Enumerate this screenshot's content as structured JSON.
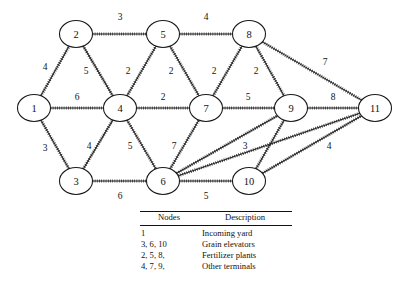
{
  "figure": {
    "kind": "network-diagram"
  },
  "chart_data": {
    "type": "diagram",
    "title": "",
    "xlabel": "",
    "ylabel": "",
    "nodes": [
      {
        "id": "1",
        "label": "1",
        "x": 34,
        "y": 108
      },
      {
        "id": "2",
        "label": "2",
        "x": 76,
        "y": 34
      },
      {
        "id": "3",
        "label": "3",
        "x": 76,
        "y": 181
      },
      {
        "id": "4",
        "label": "4",
        "x": 120,
        "y": 108
      },
      {
        "id": "5",
        "label": "5",
        "x": 163,
        "y": 34
      },
      {
        "id": "6",
        "label": "6",
        "x": 163,
        "y": 181
      },
      {
        "id": "7",
        "label": "7",
        "x": 206,
        "y": 108
      },
      {
        "id": "8",
        "label": "8",
        "x": 249,
        "y": 34
      },
      {
        "id": "9",
        "label": "9",
        "x": 291,
        "y": 108
      },
      {
        "id": "10",
        "label": "10",
        "x": 249,
        "y": 181
      },
      {
        "id": "11",
        "label": "11",
        "x": 375,
        "y": 108
      }
    ],
    "edges": [
      {
        "from": "2",
        "to": "5",
        "weight": "3",
        "lx": 120,
        "ly": 17
      },
      {
        "from": "5",
        "to": "8",
        "weight": "4",
        "lx": 206,
        "ly": 17
      },
      {
        "from": "1",
        "to": "2",
        "weight": "4",
        "lx": 45,
        "ly": 67
      },
      {
        "from": "2",
        "to": "4",
        "weight": "5",
        "lx": 86,
        "ly": 71
      },
      {
        "from": "4",
        "to": "5",
        "weight": "2",
        "lx": 128,
        "ly": 71
      },
      {
        "from": "5",
        "to": "7",
        "weight": "2",
        "lx": 171,
        "ly": 71
      },
      {
        "from": "7",
        "to": "8",
        "weight": "2",
        "lx": 214,
        "ly": 71
      },
      {
        "from": "8",
        "to": "9",
        "weight": "2",
        "lx": 256,
        "ly": 71
      },
      {
        "from": "8",
        "to": "11",
        "weight": "7",
        "lx": 325,
        "ly": 62
      },
      {
        "from": "1",
        "to": "4",
        "weight": "6",
        "lx": 77,
        "ly": 97
      },
      {
        "from": "4",
        "to": "7",
        "weight": "2",
        "lx": 163,
        "ly": 97
      },
      {
        "from": "7",
        "to": "9",
        "weight": "5",
        "lx": 248,
        "ly": 97
      },
      {
        "from": "9",
        "to": "11",
        "weight": "8",
        "lx": 333,
        "ly": 97
      },
      {
        "from": "1",
        "to": "3",
        "weight": "3",
        "lx": 45,
        "ly": 148
      },
      {
        "from": "3",
        "to": "4",
        "weight": "4",
        "lx": 89,
        "ly": 146
      },
      {
        "from": "4",
        "to": "6",
        "weight": "5",
        "lx": 130,
        "ly": 146
      },
      {
        "from": "6",
        "to": "7",
        "weight": "7",
        "lx": 174,
        "ly": 146
      },
      {
        "from": "6",
        "to": "9",
        "weight": "3",
        "lx": 245,
        "ly": 146
      },
      {
        "from": "10",
        "to": "11",
        "weight": "4",
        "lx": 329,
        "ly": 146
      },
      {
        "from": "3",
        "to": "6",
        "weight": "6",
        "lx": 120,
        "ly": 196
      },
      {
        "from": "6",
        "to": "10",
        "weight": "5",
        "lx": 206,
        "ly": 196
      },
      {
        "from": "6",
        "to": "11",
        "weight": "",
        "lx": 0,
        "ly": 0
      },
      {
        "from": "9",
        "to": "10",
        "weight": "",
        "lx": 0,
        "ly": 0
      }
    ]
  },
  "legend": {
    "headers": {
      "nodes": "Nodes",
      "description": "Description"
    },
    "rows": [
      {
        "nodes": "1",
        "description": "Incoming yard"
      },
      {
        "nodes": "3, 6, 10",
        "description": "Grain elevators"
      },
      {
        "nodes": "2, 5, 8,",
        "description": "Fertilizer plants"
      },
      {
        "nodes": "4, 7, 9,",
        "description": "Other terminals"
      }
    ]
  },
  "colors": {
    "ink": "#111111",
    "background": "#ffffff"
  }
}
